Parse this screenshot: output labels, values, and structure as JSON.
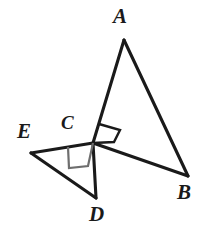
{
  "figure": {
    "kind": "geometry-diagram",
    "background_color": "#ffffff",
    "stroke_color": "#1a1a1a",
    "right_angle_mark_color_primary": "#1a1a1a",
    "right_angle_mark_color_secondary": "#6e6e6e",
    "labels": {
      "A": "A",
      "B": "B",
      "C": "C",
      "D": "D",
      "E": "E"
    },
    "points": {
      "A": {
        "x": 124,
        "y": 40
      },
      "B": {
        "x": 188,
        "y": 176
      },
      "C": {
        "x": 93,
        "y": 143
      },
      "D": {
        "x": 96,
        "y": 198
      },
      "E": {
        "x": 31,
        "y": 153
      }
    },
    "segments": [
      {
        "name": "AC",
        "from": "A",
        "to": "C"
      },
      {
        "name": "AB",
        "from": "A",
        "to": "B"
      },
      {
        "name": "CB",
        "from": "C",
        "to": "B"
      },
      {
        "name": "EC",
        "from": "E",
        "to": "C"
      },
      {
        "name": "ED",
        "from": "E",
        "to": "D"
      },
      {
        "name": "CD",
        "from": "C",
        "to": "D"
      }
    ],
    "right_angles": [
      {
        "name": "angle-ACB",
        "at": "C",
        "between": [
          "CA",
          "CB"
        ],
        "measure": "90",
        "style": "dark"
      },
      {
        "name": "angle-ECD",
        "at": "C",
        "between": [
          "CE",
          "CD"
        ],
        "measure": "90",
        "style": "gray"
      }
    ]
  }
}
